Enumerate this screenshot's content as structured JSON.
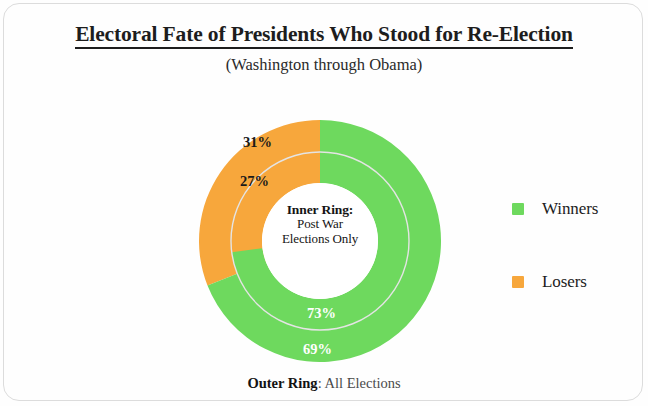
{
  "header": {
    "title": "Electoral Fate of Presidents Who Stood for Re-Election",
    "subtitle": "(Washington through Obama)"
  },
  "center_label": {
    "heading": "Inner Ring:",
    "line1": "Post War",
    "line2": "Elections Only"
  },
  "legend": {
    "items": [
      {
        "label": "Winners",
        "color": "#6ed95e",
        "swatch_name": "legend-swatch-winners"
      },
      {
        "label": "Losers",
        "color": "#f7a73c",
        "swatch_name": "legend-swatch-losers"
      }
    ]
  },
  "footer": {
    "bold": "Outer Ring",
    "rest": ": All Elections"
  },
  "slice_labels": {
    "outer_losers": "31%",
    "inner_losers": "27%",
    "inner_winners": "73%",
    "outer_winners": "69%"
  },
  "colors": {
    "winners": "#6ed95e",
    "losers": "#f7a73c",
    "divider": "#e8e8e8",
    "background": "#fefefe",
    "text": "#1a1a1a"
  },
  "chart_data": {
    "type": "pie",
    "title": "Electoral Fate of Presidents Who Stood for Re-Election",
    "subtitle": "(Washington through Obama)",
    "variant": "nested-donut",
    "legend_position": "right",
    "grid": false,
    "center_text": "Inner Ring: Post War Elections Only",
    "footer_text": "Outer Ring: All Elections",
    "rings": [
      {
        "name": "Outer Ring",
        "description": "All Elections",
        "radius_fraction": [
          0.48,
          1.0
        ],
        "start_angle_deg": 0,
        "direction": "counterclockwise",
        "slices": [
          {
            "label": "Losers",
            "value": 31,
            "display": "31%",
            "color": "#f7a73c",
            "label_color": "#1a1a1a"
          },
          {
            "label": "Winners",
            "value": 69,
            "display": "69%",
            "color": "#6ed95e",
            "label_color": "#ffffff"
          }
        ]
      },
      {
        "name": "Inner Ring",
        "description": "Post War Elections Only",
        "radius_fraction": [
          0.48,
          0.735
        ],
        "start_angle_deg": 0,
        "direction": "counterclockwise",
        "slices": [
          {
            "label": "Losers",
            "value": 27,
            "display": "27%",
            "color": "#f7a73c",
            "label_color": "#1a1a1a"
          },
          {
            "label": "Winners",
            "value": 73,
            "display": "73%",
            "color": "#6ed95e",
            "label_color": "#ffffff"
          }
        ]
      }
    ],
    "categories": [
      "Winners",
      "Losers"
    ],
    "series": [
      {
        "name": "All Elections",
        "values": [
          69,
          31
        ]
      },
      {
        "name": "Post War Elections Only",
        "values": [
          73,
          27
        ]
      }
    ]
  }
}
